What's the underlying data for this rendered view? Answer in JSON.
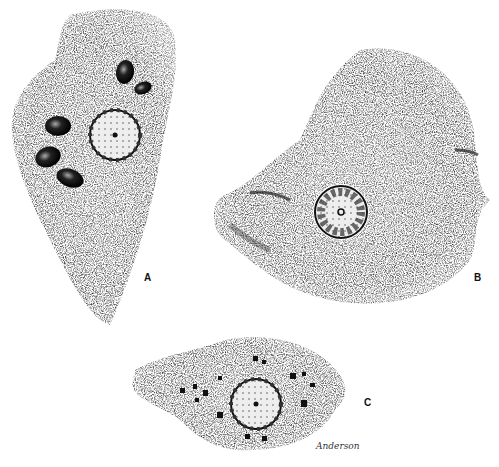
{
  "figure": {
    "panels": [
      {
        "id": "A",
        "label": "A",
        "description": "amoeba with nucleus and five ingested dark bodies"
      },
      {
        "id": "B",
        "label": "B",
        "description": "broad amoeba with central nucleus and two pseudopod folds"
      },
      {
        "id": "C",
        "label": "C",
        "description": "elongated amoeba with nucleus and scattered dark inclusions"
      }
    ],
    "signature": "Anderson",
    "colors": {
      "ink": "#111111",
      "background": "#ffffff",
      "stipple": "#8a8a8a"
    }
  }
}
